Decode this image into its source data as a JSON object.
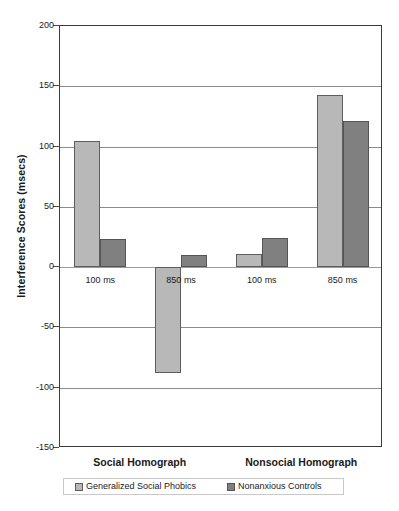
{
  "chart_data": {
    "type": "bar",
    "title": "",
    "xlabel": "",
    "ylabel": "Interference Scores (msecs)",
    "ylim": [
      -150,
      200
    ],
    "ytick_step": 50,
    "yticks": [
      200,
      150,
      100,
      50,
      0,
      -50,
      -100,
      -150
    ],
    "ytick_labels": [
      "200",
      "150",
      "100",
      "50",
      "0",
      "-50",
      "-100",
      "-150"
    ],
    "grid": true,
    "legend_position": "bottom",
    "groups": [
      "Social Homograph",
      "Nonsocial Homograph"
    ],
    "categories": [
      "100 ms",
      "850 ms",
      "100 ms",
      "850 ms"
    ],
    "series": [
      {
        "name": "Generalized Social Phobics",
        "color": "#b8b8b8",
        "values": [
          105,
          -88,
          11,
          143
        ]
      },
      {
        "name": "Nonanxious Controls",
        "color": "#808080",
        "values": [
          23,
          10,
          24,
          121
        ]
      }
    ]
  },
  "legend": {
    "items": [
      {
        "label": "Generalized Social Phobics",
        "swatch": "light"
      },
      {
        "label": "Nonanxious Controls",
        "swatch": "dark"
      }
    ]
  },
  "colors": {
    "light_bar": "#b8b8b8",
    "dark_bar": "#808080",
    "axis": "#3a3a3a",
    "gridline": "#8a8a8a",
    "background": "#ffffff"
  }
}
